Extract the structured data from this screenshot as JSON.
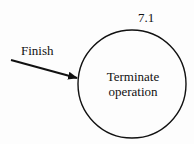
{
  "diagram": {
    "process": {
      "id": "7.1",
      "label_line1": "Terminate",
      "label_line2": "operation"
    },
    "input_flow": {
      "label": "Finish"
    },
    "colors": {
      "stroke": "#111111",
      "background": "#fdfdfd"
    }
  }
}
